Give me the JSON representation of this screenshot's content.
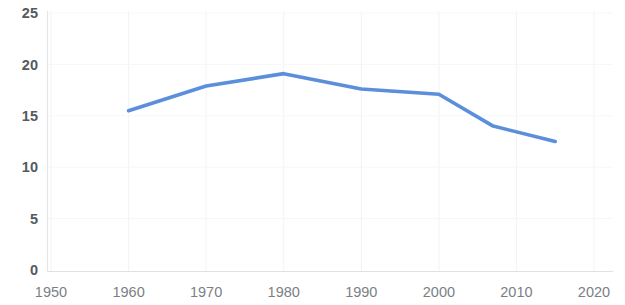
{
  "chart_data": {
    "type": "line",
    "title": "",
    "subtitle": "",
    "xlabel": "",
    "ylabel": "",
    "xlim": [
      1950,
      2020
    ],
    "ylim": [
      0,
      25
    ],
    "grid": true,
    "legend": "none",
    "x_ticks": [
      "1950",
      "1960",
      "1970",
      "1980",
      "1990",
      "2000",
      "2010",
      "2020"
    ],
    "x_tick_values": [
      1950,
      1960,
      1970,
      1980,
      1990,
      2000,
      2010,
      2020
    ],
    "y_ticks": [
      "0",
      "5",
      "10",
      "15",
      "20",
      "25"
    ],
    "y_tick_values": [
      0,
      5,
      10,
      15,
      20,
      25
    ],
    "series": [
      {
        "name": "series-1",
        "color": "#5b8fdb",
        "line_width": 3.6,
        "x": [
          1960,
          1970,
          1980,
          1990,
          2000,
          2007,
          2015
        ],
        "values": [
          15.5,
          17.9,
          19.1,
          17.6,
          17.1,
          14.0,
          12.5
        ]
      }
    ]
  },
  "colors": {
    "series_blue": "#5b8fdb",
    "axis_gray": "#e3e5e8",
    "grid_gray": "#f2f3f5",
    "ytick_text": "#565a5e",
    "xtick_text": "#7b7f85",
    "background": "#ffffff"
  }
}
